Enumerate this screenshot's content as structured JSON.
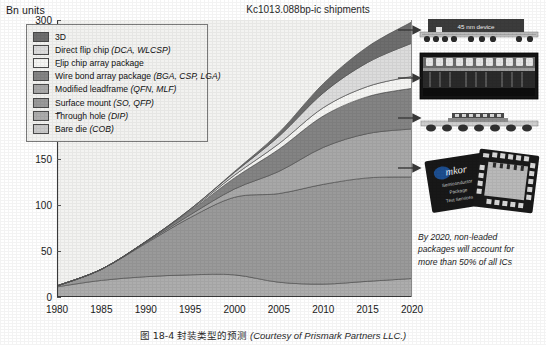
{
  "figure": {
    "unit_label": "Bn units",
    "title": "Kc1013.088bp-ic shipments",
    "caption_cn": "图 18-4  封装类型的预测",
    "caption_en": "(Courtesy of Prismark Partners LLC.)"
  },
  "annotation": {
    "line1": "By 2020, non-leaded",
    "line2": "packages will account for",
    "line3": "more than 50% of all ICs"
  },
  "photos": [
    {
      "name": "photo-45nm-device-cross-section",
      "label": "45 nm device"
    },
    {
      "name": "photo-package-cross-section-micrograph",
      "label": ""
    },
    {
      "name": "photo-bga-substrate-cross-section",
      "label": ""
    },
    {
      "name": "photo-amkor-qfn-packages",
      "label": "Amkor"
    }
  ],
  "legend": {
    "items": [
      {
        "label": "3D",
        "sub": "",
        "color": "#6e6e6e"
      },
      {
        "label": "Direct flip chip ",
        "sub": "(DCA, WLCSP)",
        "color": "#dcdcdc"
      },
      {
        "label": "Flip chip array package",
        "sub": "",
        "color": "#f5f5f3"
      },
      {
        "label": "Wire bond array package ",
        "sub": "(BGA, CSP, LGA)",
        "color": "#848484"
      },
      {
        "label": "Modified leadframe ",
        "sub": "(QFN, MLF)",
        "color": "#a8a8a8"
      },
      {
        "label": "Surface mount ",
        "sub": "(SO, QFP)",
        "color": "#9a9a9a"
      },
      {
        "label": "Through hole ",
        "sub": "(DIP)",
        "color": "#adadad"
      },
      {
        "label": "Bare die ",
        "sub": "(COB)",
        "color": "#c9c9c9"
      }
    ]
  },
  "chart_data": {
    "type": "area",
    "title": "Kc1013.088bp-ic shipments",
    "xlabel": "",
    "ylabel": "Bn units",
    "ylim": [
      0,
      300
    ],
    "xlim": [
      1980,
      2020
    ],
    "grid": false,
    "legend_position": "top-left",
    "ytick_values": [
      0,
      50,
      100,
      150,
      200,
      250,
      300
    ],
    "xtick_values": [
      1980,
      1985,
      1990,
      1995,
      2000,
      2005,
      2010,
      2015,
      2020
    ],
    "x": [
      1980,
      1985,
      1990,
      1995,
      2000,
      2005,
      2010,
      2015,
      2020
    ],
    "stack_order_bottom_to_top": [
      "Through hole (DIP)",
      "Surface mount (SO, QFP)",
      "Modified leadframe (QFN, MLF)",
      "Wire bond array package (BGA, CSP, LGA)",
      "Flip chip array package",
      "Direct flip chip (DCA, WLCSP)",
      "3D"
    ],
    "series": [
      {
        "name": "Through hole (DIP)",
        "color": "#adadad",
        "values": [
          11,
          18,
          22,
          24,
          24,
          16,
          14,
          17,
          20
        ]
      },
      {
        "name": "Surface mount (SO, QFP)",
        "color": "#9a9a9a",
        "values": [
          1,
          12,
          36,
          62,
          84,
          96,
          108,
          112,
          110
        ]
      },
      {
        "name": "Modified leadframe (QFN, MLF)",
        "color": "#a8a8a8",
        "values": [
          0,
          0,
          1,
          3,
          9,
          24,
          40,
          48,
          52
        ]
      },
      {
        "name": "Wire bond array package (BGA, CSP, LGA)",
        "color": "#848484",
        "values": [
          0,
          0,
          1,
          4,
          12,
          24,
          34,
          40,
          44
        ]
      },
      {
        "name": "Flip chip array package",
        "color": "#f5f5f3",
        "values": [
          0,
          0,
          0,
          1,
          3,
          6,
          9,
          11,
          13
        ]
      },
      {
        "name": "Direct flip chip (DCA, WLCSP)",
        "color": "#dcdcdc",
        "values": [
          0,
          0,
          0,
          1,
          3,
          8,
          16,
          26,
          36
        ]
      },
      {
        "name": "3D",
        "color": "#6e6e6e",
        "values": [
          0,
          0,
          0,
          0,
          1,
          4,
          10,
          17,
          23
        ]
      }
    ],
    "totals": [
      12,
      30,
      60,
      95,
      136,
      178,
      231,
      271,
      298
    ],
    "annotation": "By 2020, non-leaded packages will account for more than 50% of all ICs"
  }
}
